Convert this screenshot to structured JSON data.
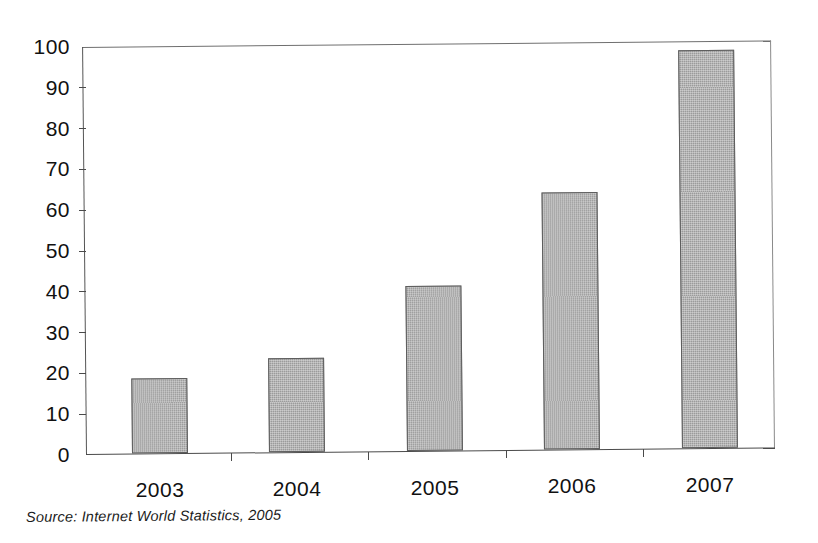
{
  "chart_data": {
    "type": "bar",
    "title": "",
    "subtitle": "",
    "categories": [
      "2003",
      "2004",
      "2005",
      "2006",
      "2007"
    ],
    "values": [
      18.5,
      23,
      40.5,
      63,
      97.5
    ],
    "xlabel": "",
    "ylabel": "",
    "ylim": [
      0,
      100
    ],
    "ytick_labels": [
      "0",
      "10",
      "20",
      "30",
      "40",
      "50",
      "60",
      "70",
      "80",
      "90",
      "100"
    ],
    "ytick_values": [
      0,
      10,
      20,
      30,
      40,
      50,
      60,
      70,
      80,
      90,
      100
    ],
    "ytick_step": 10,
    "grid": false,
    "legend": null,
    "legend_position": "none",
    "bar_fill_color": "#9b9b9b",
    "bar_border_color": "#5d5d5d",
    "axis_color": "#4a4a4a",
    "background_color": "#ffffff",
    "annotations": []
  },
  "caption": {
    "source_note": "Source:  Internet World Statistics, 2005"
  }
}
